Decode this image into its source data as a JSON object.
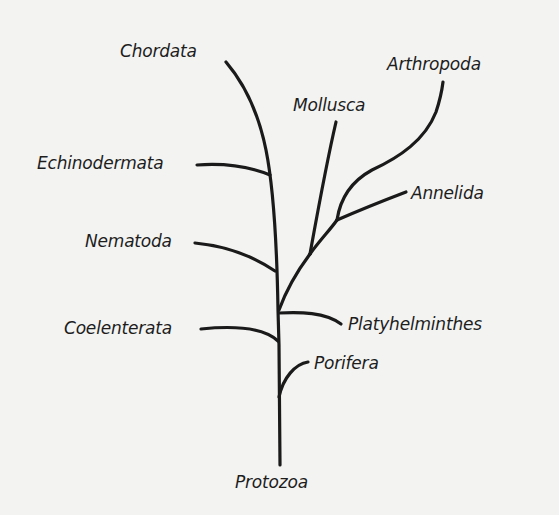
{
  "diagram": {
    "type": "phylogenetic-tree",
    "root": "Protozoa",
    "line_color": "#1a1a1a",
    "background_color": "#f3f3f2",
    "labels": {
      "chordata": "Chordata",
      "arthropoda": "Arthropoda",
      "mollusca": "Mollusca",
      "echinodermata": "Echinodermata",
      "annelida": "Annelida",
      "nematoda": "Nematoda",
      "platyhelminthes": "Platyhelminthes",
      "coelenterata": "Coelenterata",
      "porifera": "Porifera",
      "protozoa": "Protozoa"
    },
    "branches": [
      {
        "from": "Protozoa",
        "to": "Porifera",
        "side": "right"
      },
      {
        "from": "Protozoa",
        "to": "Coelenterata",
        "side": "left"
      },
      {
        "from": "Protozoa",
        "to": "Platyhelminthes",
        "side": "right"
      },
      {
        "from": "Protozoa",
        "to": "Nematoda",
        "side": "left"
      },
      {
        "from": "Protozoa",
        "to": "Echinodermata",
        "side": "left"
      },
      {
        "from": "Protozoa",
        "to": "Chordata",
        "side": "top"
      },
      {
        "from": "Protozoa",
        "to": "Mollusca",
        "side": "right"
      },
      {
        "from": "Mollusca-node",
        "to": "Annelida",
        "side": "right"
      },
      {
        "from": "Annelida-node",
        "to": "Arthropoda",
        "side": "right"
      }
    ]
  }
}
